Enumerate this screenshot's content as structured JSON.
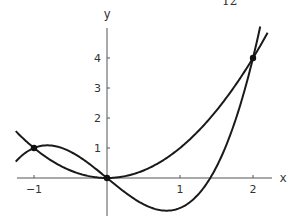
{
  "page": {
    "corner_label": "12"
  },
  "chart_data": {
    "type": "line",
    "title": "",
    "xlabel": "x",
    "ylabel": "y",
    "xlim": [
      -1.25,
      2.25
    ],
    "ylim": [
      -1.25,
      5
    ],
    "x_ticks": [
      -1,
      1,
      2
    ],
    "y_ticks": [
      1,
      2,
      3,
      4
    ],
    "grid": false,
    "legend": null,
    "series": [
      {
        "name": "y = x^2",
        "formula": "x^2",
        "x_range": [
          -1.25,
          2.2
        ]
      },
      {
        "name": "y = x^3 - 2x",
        "formula": "x^3 - 2x",
        "x_range": [
          -1.25,
          2.15
        ]
      }
    ],
    "intersection_points": [
      {
        "x": -1,
        "y": 1
      },
      {
        "x": 0,
        "y": 0
      },
      {
        "x": 2,
        "y": 4
      }
    ]
  }
}
